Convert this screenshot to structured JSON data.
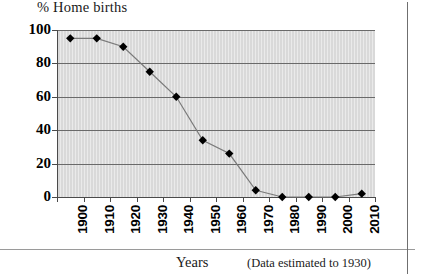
{
  "chart_data": {
    "type": "line",
    "title": "% Home births",
    "xlabel": "Years",
    "ylabel": "",
    "note": "(Data estimated to 1930)",
    "categories": [
      "1900",
      "1910",
      "1920",
      "1930",
      "1940",
      "1950",
      "1960",
      "1970",
      "1980",
      "1990",
      "2000",
      "2010"
    ],
    "values": [
      95,
      95,
      90,
      75,
      60,
      34,
      26,
      4,
      0,
      0,
      0,
      2
    ],
    "series": [
      {
        "name": "% Home births",
        "values": [
          95,
          95,
          90,
          75,
          60,
          34,
          26,
          4,
          0,
          0,
          0,
          2
        ]
      }
    ],
    "ylim": [
      0,
      100
    ],
    "yticks": [
      "0",
      "20",
      "40",
      "60",
      "80",
      "100"
    ],
    "ytick_values": [
      0,
      20,
      40,
      60,
      80,
      100
    ],
    "grid": true,
    "legend": false,
    "marker": "diamond",
    "colors": {
      "plot_background": "#d9d9d9",
      "gridline": "#6a6a6a",
      "line": "#7a7a7a",
      "marker": "#000000",
      "axis": "#4a4a4a",
      "text": "#1a1a1a",
      "page_border": "#6f6f6f"
    }
  }
}
